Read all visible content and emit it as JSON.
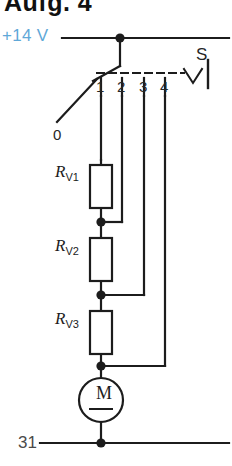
{
  "figure": {
    "heading": "Aufg. 4",
    "type": "circuit-schematic"
  },
  "supply": {
    "label": "+14 V",
    "color": "#5fa8d8"
  },
  "ground": {
    "label": "31"
  },
  "rotary_switch": {
    "label": "S",
    "off_position": "0",
    "contacts": [
      {
        "number": "1"
      },
      {
        "number": "2"
      },
      {
        "number": "3"
      },
      {
        "number": "4"
      }
    ]
  },
  "resistors": [
    {
      "symbol": "R",
      "subscript": "V1"
    },
    {
      "symbol": "R",
      "subscript": "V2"
    },
    {
      "symbol": "R",
      "subscript": "V3"
    }
  ],
  "motor": {
    "label": "M",
    "kind": "dc-motor"
  },
  "colors": {
    "wire": "#1c1c1c",
    "supply_text": "#5fa8d8",
    "background": "#ffffff"
  }
}
